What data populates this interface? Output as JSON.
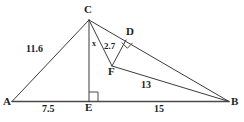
{
  "figure": {
    "type": "geometry-diagram",
    "background_color": "#ffffff",
    "line_color": "#3b3b3b",
    "text_color": "#1d1d1d"
  },
  "vertices": [
    {
      "id": "A",
      "label": "A",
      "x": 12,
      "y": 103
    },
    {
      "id": "B",
      "label": "B",
      "x": 229,
      "y": 103
    },
    {
      "id": "C",
      "label": "C",
      "x": 89,
      "y": 20
    },
    {
      "id": "D",
      "label": "D",
      "x": 126,
      "y": 40
    },
    {
      "id": "E",
      "label": "E",
      "x": 89,
      "y": 101
    },
    {
      "id": "F",
      "label": "F",
      "x": 112,
      "y": 66
    }
  ],
  "vertex_labels": [
    {
      "name": "vertex-label-c",
      "text": "C",
      "x": 84,
      "y": 4
    },
    {
      "name": "vertex-label-d",
      "text": "D",
      "x": 126,
      "y": 27
    },
    {
      "name": "vertex-label-f",
      "text": "F",
      "x": 108,
      "y": 66
    },
    {
      "name": "vertex-label-a",
      "text": "A",
      "x": 4,
      "y": 97
    },
    {
      "name": "vertex-label-e",
      "text": "E",
      "x": 85,
      "y": 103
    },
    {
      "name": "vertex-label-b",
      "text": "B",
      "x": 231,
      "y": 97
    }
  ],
  "segments": [
    {
      "name": "segment-ab",
      "from": "A",
      "to": "B",
      "style": "base"
    },
    {
      "name": "segment-ac",
      "from": "A",
      "to": "C",
      "style": "normal"
    },
    {
      "name": "segment-ce",
      "from": "C",
      "to": "E",
      "style": "normal"
    },
    {
      "name": "segment-cb",
      "from": "C",
      "to": "B",
      "style": "normal"
    },
    {
      "name": "segment-cf",
      "from": "C",
      "to": "F",
      "style": "normal"
    },
    {
      "name": "segment-df",
      "from": "D",
      "to": "F",
      "style": "normal"
    },
    {
      "name": "segment-fb",
      "from": "F",
      "to": "B",
      "style": "normal"
    }
  ],
  "measure_labels": [
    {
      "name": "length-label-ac",
      "text": "11.6",
      "x": 26,
      "y": 45,
      "size": "len"
    },
    {
      "name": "length-label-cf",
      "text": "x",
      "x": 92,
      "y": 40,
      "size": "var"
    },
    {
      "name": "length-label-df",
      "text": "2.7",
      "x": 104,
      "y": 42,
      "size": "len-sm"
    },
    {
      "name": "length-label-fb",
      "text": "13",
      "x": 141,
      "y": 80,
      "size": "len"
    },
    {
      "name": "length-label-ae",
      "text": "7.5",
      "x": 42,
      "y": 105,
      "size": "len"
    },
    {
      "name": "length-label-eb",
      "text": "15",
      "x": 154,
      "y": 105,
      "size": "len"
    }
  ],
  "right_angles": [
    {
      "name": "right-angle-marker-e",
      "at": "E",
      "points": "89,91 98,91 98,101"
    },
    {
      "name": "right-angle-marker-d",
      "at": "D",
      "points": "122,44 127,49 132,44"
    }
  ]
}
